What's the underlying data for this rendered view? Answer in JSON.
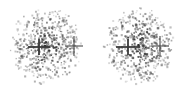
{
  "figure": {
    "title": "",
    "background_color": "#ffffff",
    "width": 185,
    "height": 93,
    "panel_count": 2
  },
  "panels": [
    {
      "id": "left-panel",
      "label": "",
      "origin_x": 0,
      "origin_y": 0,
      "width": 93,
      "height": 93
    },
    {
      "id": "right-panel",
      "label": "",
      "origin_x": 93,
      "origin_y": 0,
      "width": 92,
      "height": 93
    }
  ],
  "chart_data": {
    "type": "scatter",
    "title": "",
    "subtitle": "",
    "xlabel": "",
    "ylabel": "",
    "xlim": [
      0,
      185
    ],
    "ylim": [
      0,
      93
    ],
    "grid": false,
    "legend": null,
    "axes_visible": false,
    "tick_labels": {
      "x": [],
      "y": []
    },
    "point_style": {
      "marker": "square",
      "size_px": 1.6,
      "colors": [
        "#4a4a4a",
        "#707070",
        "#999999",
        "#bbbbbb",
        "#2e2e2e"
      ],
      "opacity_range": [
        0.35,
        1.0
      ]
    },
    "series": [
      {
        "name": "left-cloud",
        "center_x": 46,
        "center_y": 46,
        "radius_x": 36,
        "radius_y": 39,
        "n_points": 620,
        "density_profile": "radial-falloff",
        "core_density_boost": 1.35,
        "seed": 1771
      },
      {
        "name": "right-cloud",
        "center_x": 139,
        "center_y": 46,
        "radius_x": 36,
        "radius_y": 39,
        "n_points": 620,
        "density_profile": "radial-falloff",
        "core_density_boost": 1.35,
        "seed": 9043
      }
    ],
    "annotations": [
      {
        "name": "left-inner-crosshair",
        "type": "crosshair",
        "x": 39,
        "y": 47,
        "half_width": 11,
        "half_height": 8,
        "line_width": 1.8,
        "color": "#3a3a3a",
        "note": "thick dark horizontal bar with short vertical arm, inside left cloud"
      },
      {
        "name": "left-outer-crosshair",
        "type": "crosshair",
        "x": 74,
        "y": 46,
        "half_width": 9,
        "half_height": 10,
        "line_width": 1.1,
        "color": "#4a4a4a",
        "note": "thin plus marker right of left cloud centre"
      },
      {
        "name": "right-inner-crosshair",
        "type": "crosshair",
        "x": 128,
        "y": 47,
        "half_width": 12,
        "half_height": 8,
        "line_width": 1.8,
        "color": "#3a3a3a",
        "note": "thick dark horizontal bar with short vertical arm, inside right cloud"
      },
      {
        "name": "right-outer-crosshair",
        "type": "crosshair",
        "x": 160,
        "y": 46,
        "half_width": 9,
        "half_height": 10,
        "line_width": 1.1,
        "color": "#4a4a4a",
        "note": "thin plus marker right of right cloud centre"
      }
    ]
  },
  "colors": {
    "background": "#ffffff",
    "point_dark": "#3a3a3a",
    "point_mid": "#7a7a7a",
    "point_light": "#b4b4b4",
    "crosshair": "#3a3a3a"
  },
  "accessibility": {
    "description": "Two circular scatter point clouds side by side, each marked with an inner dark crosshair and an outer thin plus symbol."
  }
}
